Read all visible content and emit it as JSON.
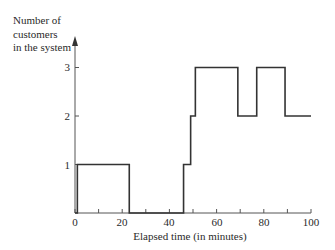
{
  "chart_data": {
    "type": "line",
    "subtype": "step",
    "title": "",
    "xlabel": "Elapsed time (in minutes)",
    "ylabel": "Number of customers in the system",
    "ylabel_lines": [
      "Number of",
      "customers",
      "in the system"
    ],
    "xlim": [
      0,
      100
    ],
    "ylim": [
      0,
      3
    ],
    "x_ticks": [
      0,
      10,
      20,
      30,
      40,
      50,
      60,
      70,
      80,
      90,
      100
    ],
    "x_tick_labels": [
      "0",
      "20",
      "40",
      "60",
      "80",
      "100"
    ],
    "y_ticks": [
      1,
      2,
      3
    ],
    "y_tick_labels": [
      "1",
      "2",
      "3"
    ],
    "grid": false,
    "legend": null,
    "series": [
      {
        "name": "Number of customers",
        "steps": [
          {
            "start": 0,
            "end": 1,
            "value": 0
          },
          {
            "start": 1,
            "end": 23,
            "value": 1
          },
          {
            "start": 23,
            "end": 46,
            "value": 0
          },
          {
            "start": 46,
            "end": 49,
            "value": 1
          },
          {
            "start": 49,
            "end": 51,
            "value": 2
          },
          {
            "start": 51,
            "end": 69,
            "value": 3
          },
          {
            "start": 69,
            "end": 77,
            "value": 2
          },
          {
            "start": 77,
            "end": 89,
            "value": 3
          },
          {
            "start": 89,
            "end": 100,
            "value": 2
          }
        ]
      }
    ]
  }
}
